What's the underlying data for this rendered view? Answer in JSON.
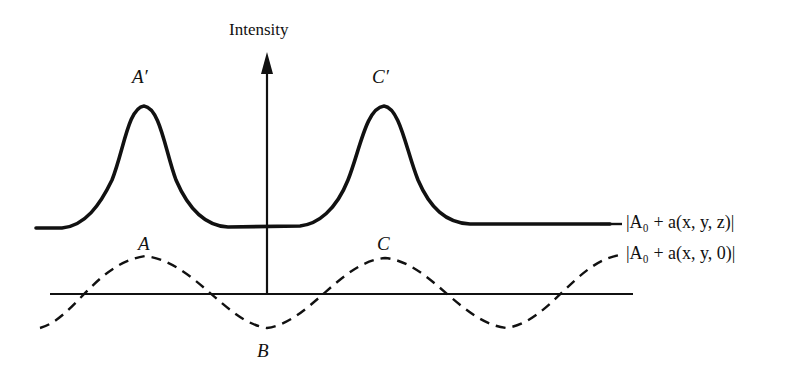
{
  "diagram": {
    "axis": {
      "vertical_label": "Intensity"
    },
    "curves": [
      {
        "id": "intensity-at-z",
        "style": "solid",
        "legend": "|A₀ + a(x, y, z)|",
        "peaks": [
          "A′",
          "C′"
        ]
      },
      {
        "id": "intensity-at-0",
        "style": "dashed",
        "legend": "|A₀ + a(x, y, 0)|",
        "peaks": [
          "A",
          "C"
        ],
        "troughs": [
          "B"
        ]
      }
    ],
    "point_labels": {
      "a_prime": "A′",
      "c_prime": "C′",
      "a": "A",
      "b": "B",
      "c": "C"
    },
    "colors": {
      "stroke": "#111111",
      "background": "#ffffff"
    }
  }
}
